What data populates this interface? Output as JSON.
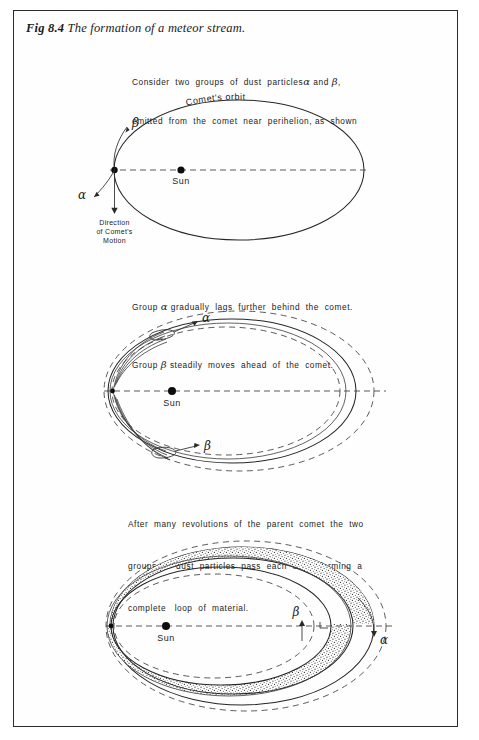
{
  "figure": {
    "caption_number": "Fig 8.4",
    "caption_text": "The formation of a meteor stream.",
    "border_color": "#2b2b2b",
    "ink_color": "#232323"
  },
  "intro_text": {
    "line1": "Consider  two  groups  of  dust  particles",
    "alpha": "α",
    "and": "and",
    "beta": "β",
    "comma": ",",
    "line2": "emitted  from  the  comet  near  perihelion, as  shown"
  },
  "panel1": {
    "name": "initial-emission-diagram",
    "orbit_label": "Comet's orbit",
    "sun_label": "Sun",
    "alpha_label": "α",
    "beta_label": "β",
    "direction_line1": "Direction",
    "direction_line2": "of Comet's",
    "direction_line3": "Motion"
  },
  "mid_text": {
    "line1_pre": "Group",
    "line1_greek": "α",
    "line1_post": "gradually  lags  further  behind  the  comet.",
    "line2_pre": "Group",
    "line2_greek": "β",
    "line2_post": "steadily  moves  ahead  of  the  comet."
  },
  "panel2": {
    "name": "separating-groups-diagram",
    "sun_label": "Sun",
    "alpha_label": "α",
    "beta_label": "β"
  },
  "lower_text": {
    "line1": "After  many  revolutions  of  the  parent  comet  the  two",
    "line2": "groups  of  dust  particles  pass  each  other  forming  a",
    "line3": "complete   loop  of  material."
  },
  "panel3": {
    "name": "complete-loop-diagram",
    "sun_label": "Sun",
    "alpha_label": "α",
    "beta_label": "β"
  }
}
